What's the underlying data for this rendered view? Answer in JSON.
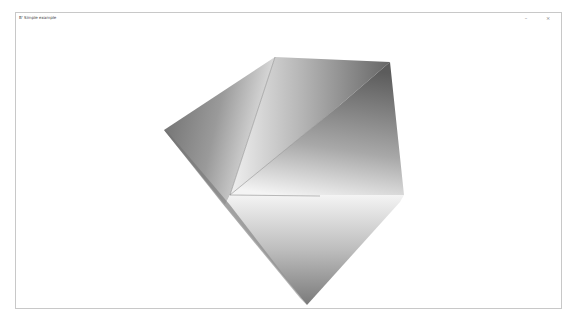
{
  "window": {
    "title": "B' Simple example",
    "controls": {
      "minimize": "–",
      "close": "×"
    }
  },
  "scene": {
    "description": "Gouraud-shaded 3D polygon mesh (grayscale)",
    "colors": {
      "dark": "#5a5a5a",
      "mid": "#9a9a9a",
      "light": "#f2f2f2",
      "edge": "#8a8a8a"
    }
  }
}
